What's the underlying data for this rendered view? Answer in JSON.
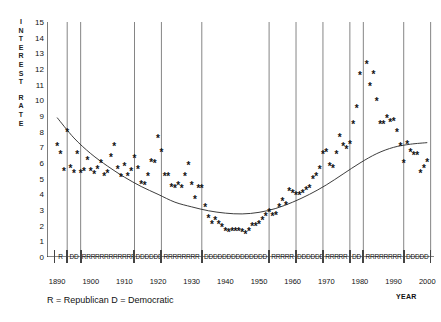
{
  "chart_data": {
    "type": "scatter",
    "title": "",
    "subtitle": "",
    "xlabel": "YEAR",
    "ylabel": "INTEREST RATE",
    "ylabel_lines": [
      "I",
      "N",
      "T",
      "E",
      "R",
      "E",
      "S",
      "T",
      "",
      "R",
      "A",
      "T",
      "E"
    ],
    "xlim": [
      1887,
      2002
    ],
    "ylim": [
      0,
      15
    ],
    "grid": "vertical-party-boundaries",
    "legend": "R = Republican   D = Democratic",
    "legend_position": "below-axis-left",
    "yticks": [
      0,
      1,
      2,
      3,
      4,
      5,
      6,
      7,
      8,
      9,
      10,
      11,
      12,
      13,
      14,
      15
    ],
    "xticks": [
      1890,
      1900,
      1910,
      1920,
      1930,
      1940,
      1950,
      1960,
      1970,
      1980,
      1990,
      2000
    ],
    "xticklabels": [
      "1890",
      "1900",
      "1910",
      "1920",
      "1930",
      "1940",
      "1950",
      "1960",
      "1970",
      "1980",
      "1990",
      "2000"
    ],
    "marker": "asterisk",
    "marker_color": "#111111",
    "trend_color": "#333333",
    "series": [
      {
        "name": "Interest rate (annual)",
        "marker": "*",
        "points": [
          [
            1890,
            7.0
          ],
          [
            1891,
            6.5
          ],
          [
            1892,
            5.4
          ],
          [
            1893,
            7.9
          ],
          [
            1894,
            5.6
          ],
          [
            1895,
            5.3
          ],
          [
            1896,
            6.5
          ],
          [
            1897,
            5.3
          ],
          [
            1898,
            5.4
          ],
          [
            1899,
            6.1
          ],
          [
            1900,
            5.4
          ],
          [
            1901,
            5.2
          ],
          [
            1902,
            5.5
          ],
          [
            1903,
            5.9
          ],
          [
            1904,
            5.1
          ],
          [
            1905,
            5.3
          ],
          [
            1906,
            6.3
          ],
          [
            1907,
            7.0
          ],
          [
            1908,
            5.5
          ],
          [
            1909,
            5.0
          ],
          [
            1910,
            5.7
          ],
          [
            1911,
            5.1
          ],
          [
            1912,
            5.4
          ],
          [
            1913,
            6.2
          ],
          [
            1914,
            5.5
          ],
          [
            1915,
            4.6
          ],
          [
            1916,
            4.5
          ],
          [
            1917,
            5.1
          ],
          [
            1918,
            6.0
          ],
          [
            1919,
            5.9
          ],
          [
            1920,
            7.5
          ],
          [
            1921,
            6.6
          ],
          [
            1922,
            5.1
          ],
          [
            1923,
            5.1
          ],
          [
            1924,
            4.4
          ],
          [
            1925,
            4.3
          ],
          [
            1926,
            4.5
          ],
          [
            1927,
            4.3
          ],
          [
            1928,
            5.1
          ],
          [
            1929,
            5.8
          ],
          [
            1930,
            4.5
          ],
          [
            1931,
            3.6
          ],
          [
            1932,
            4.3
          ],
          [
            1933,
            4.3
          ],
          [
            1934,
            3.1
          ],
          [
            1935,
            2.4
          ],
          [
            1936,
            2.0
          ],
          [
            1937,
            2.3
          ],
          [
            1938,
            2.0
          ],
          [
            1939,
            1.8
          ],
          [
            1940,
            1.6
          ],
          [
            1941,
            1.5
          ],
          [
            1942,
            1.6
          ],
          [
            1943,
            1.6
          ],
          [
            1944,
            1.6
          ],
          [
            1945,
            1.5
          ],
          [
            1946,
            1.4
          ],
          [
            1947,
            1.6
          ],
          [
            1948,
            1.9
          ],
          [
            1949,
            1.9
          ],
          [
            1950,
            2.0
          ],
          [
            1951,
            2.3
          ],
          [
            1952,
            2.5
          ],
          [
            1953,
            2.8
          ],
          [
            1954,
            2.5
          ],
          [
            1955,
            2.6
          ],
          [
            1956,
            3.1
          ],
          [
            1957,
            3.5
          ],
          [
            1958,
            3.2
          ],
          [
            1959,
            4.1
          ],
          [
            1960,
            4.0
          ],
          [
            1961,
            3.9
          ],
          [
            1962,
            3.9
          ],
          [
            1963,
            4.0
          ],
          [
            1964,
            4.2
          ],
          [
            1965,
            4.3
          ],
          [
            1966,
            4.9
          ],
          [
            1967,
            5.1
          ],
          [
            1968,
            5.5
          ],
          [
            1969,
            6.5
          ],
          [
            1970,
            6.6
          ],
          [
            1971,
            5.7
          ],
          [
            1972,
            5.6
          ],
          [
            1973,
            6.5
          ],
          [
            1974,
            7.6
          ],
          [
            1975,
            7.0
          ],
          [
            1976,
            6.8
          ],
          [
            1977,
            7.1
          ],
          [
            1978,
            8.4
          ],
          [
            1979,
            9.4
          ],
          [
            1980,
            11.5
          ],
          [
            1981,
            15.0
          ],
          [
            1982,
            12.2
          ],
          [
            1983,
            10.8
          ],
          [
            1984,
            11.6
          ],
          [
            1985,
            9.9
          ],
          [
            1986,
            8.4
          ],
          [
            1987,
            8.4
          ],
          [
            1988,
            8.8
          ],
          [
            1989,
            8.5
          ],
          [
            1990,
            8.6
          ],
          [
            1991,
            7.9
          ],
          [
            1992,
            7.0
          ],
          [
            1993,
            5.9
          ],
          [
            1994,
            7.1
          ],
          [
            1995,
            6.6
          ],
          [
            1996,
            6.4
          ],
          [
            1997,
            6.4
          ],
          [
            1998,
            5.3
          ],
          [
            1999,
            5.6
          ],
          [
            2000,
            6.0
          ]
        ]
      }
    ],
    "trend_line": {
      "name": "fitted trend",
      "points": [
        [
          1890,
          8.9
        ],
        [
          1895,
          7.6
        ],
        [
          1900,
          6.6
        ],
        [
          1905,
          5.8
        ],
        [
          1910,
          5.1
        ],
        [
          1915,
          4.5
        ],
        [
          1920,
          4.0
        ],
        [
          1925,
          3.5
        ],
        [
          1930,
          3.2
        ],
        [
          1935,
          2.95
        ],
        [
          1940,
          2.8
        ],
        [
          1945,
          2.75
        ],
        [
          1950,
          2.85
        ],
        [
          1955,
          3.1
        ],
        [
          1960,
          3.5
        ],
        [
          1965,
          4.0
        ],
        [
          1970,
          4.6
        ],
        [
          1975,
          5.3
        ],
        [
          1980,
          6.0
        ],
        [
          1985,
          6.6
        ],
        [
          1990,
          7.0
        ],
        [
          1995,
          7.2
        ],
        [
          2000,
          7.3
        ]
      ]
    },
    "party_bands": [
      {
        "label": "R",
        "party": "Republican",
        "start": 1889,
        "end": 1893,
        "letters": "R"
      },
      {
        "label": "DD",
        "party": "Democratic",
        "start": 1893,
        "end": 1897,
        "letters": "DD"
      },
      {
        "label": "RRRRRRRRRRRR",
        "party": "Republican",
        "start": 1897,
        "end": 1913,
        "letters": "RRRRRRRRRRRR"
      },
      {
        "label": "DDDDDD",
        "party": "Democratic",
        "start": 1913,
        "end": 1921,
        "letters": "DDDDDD"
      },
      {
        "label": "RRRRRRRR",
        "party": "Republican",
        "start": 1921,
        "end": 1933,
        "letters": "RRRRRRRR"
      },
      {
        "label": "DDDDDDDDDDDDDD",
        "party": "Democratic",
        "start": 1933,
        "end": 1953,
        "letters": "DDDDDDDDDDDDDD"
      },
      {
        "label": "RRRRR",
        "party": "Republican",
        "start": 1953,
        "end": 1961,
        "letters": "RRRRR"
      },
      {
        "label": "DDDDDD",
        "party": "Democratic",
        "start": 1961,
        "end": 1969,
        "letters": "DDDDDD"
      },
      {
        "label": "RRRRR",
        "party": "Republican",
        "start": 1969,
        "end": 1977,
        "letters": "RRRRR"
      },
      {
        "label": "DD",
        "party": "Democratic",
        "start": 1977,
        "end": 1981,
        "letters": "DD"
      },
      {
        "label": "RRRRRRRR",
        "party": "Republican",
        "start": 1981,
        "end": 1993,
        "letters": "RRRRRRRR"
      },
      {
        "label": "DDDDD",
        "party": "Democratic",
        "start": 1993,
        "end": 2001,
        "letters": "DDDDD"
      }
    ],
    "party_boundaries": [
      1893,
      1897,
      1913,
      1921,
      1933,
      1953,
      1961,
      1969,
      1977,
      1981,
      1993,
      2001
    ]
  },
  "colors": {
    "axis": "#111111",
    "marker": "#111111",
    "trend": "#333333",
    "gridline": "#777777",
    "background": "#ffffff"
  }
}
